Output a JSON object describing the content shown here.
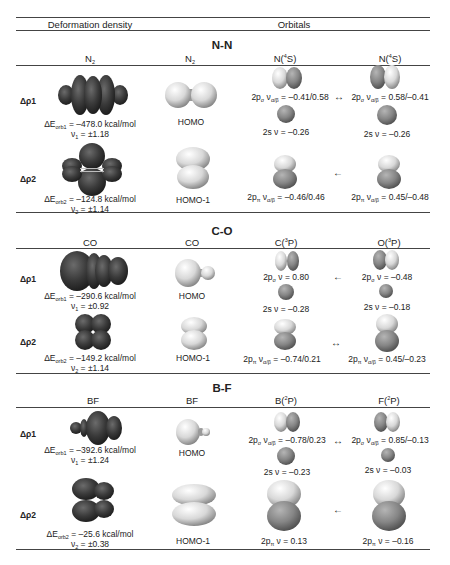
{
  "table": {
    "header_left": "Deformation density",
    "header_right": "Orbitals"
  },
  "sections": [
    {
      "title": "N-N",
      "columns": {
        "density": {
          "base": "N",
          "sub": "2"
        },
        "orbital": {
          "base": "N",
          "sub": "2"
        },
        "atom_a": {
          "base": "N(",
          "sup": "4",
          "tail": "S)"
        },
        "atom_b": {
          "base": "N(",
          "sup": "4",
          "tail": "S)"
        }
      },
      "rows": [
        {
          "label": "Δρ1",
          "energy_prefix": "ΔE",
          "energy_sub": "orb1",
          "energy_value": " = –478.0 kcal/mol",
          "nu_prefix": "ν",
          "nu_sub": "1",
          "nu_value": " = ±1.18",
          "mo": "HOMO",
          "a1": {
            "p": "2p",
            "psub": "σ",
            "nu": " ν",
            "nusub": "α/β",
            "val": " = –0.41/0.58"
          },
          "a2": {
            "p": "2s ν = –0.26"
          },
          "arrow": "↔",
          "b1": {
            "p": "2p",
            "psub": "σ",
            "nu": " ν",
            "nusub": "α/β",
            "val": " = 0.58/–0.41"
          },
          "b2": {
            "p": "2s ν = –0.26"
          }
        },
        {
          "label": "Δρ2",
          "energy_prefix": "ΔE",
          "energy_sub": "orb2",
          "energy_value": " = –124.8 kcal/mol",
          "nu_prefix": "ν",
          "nu_sub": "2",
          "nu_value": " = ±1.14",
          "mo": "HOMO-1",
          "a1": {
            "p": "2p",
            "psub": "π",
            "nu": " ν",
            "nusub": "α/β",
            "val": " = –0.46/0.46"
          },
          "arrow": "←",
          "b1": {
            "p": "2p",
            "psub": "π",
            "nu": " ν",
            "nusub": "α/β",
            "val": " = 0.45/–0.48"
          }
        }
      ]
    },
    {
      "title": "C-O",
      "columns": {
        "density": {
          "base": "CO"
        },
        "orbital": {
          "base": "CO"
        },
        "atom_a": {
          "base": "C(",
          "sup": "3",
          "tail": "P)"
        },
        "atom_b": {
          "base": "O(",
          "sup": "3",
          "tail": "P)"
        }
      },
      "rows": [
        {
          "label": "Δρ1",
          "energy_prefix": "ΔE",
          "energy_sub": "orb1",
          "energy_value": " = –290.6 kcal/mol",
          "nu_prefix": "ν",
          "nu_sub": "1",
          "nu_value": " = ±0.92",
          "mo": "HOMO",
          "a1": {
            "p": "2p",
            "psub": "σ",
            "nu": " ν",
            "val": " = 0.80"
          },
          "a2": {
            "p": "2s ν = –0.28"
          },
          "arrow": "←",
          "b1": {
            "p": "2p",
            "psub": "σ",
            "nu": " ν",
            "val": " = –0.48"
          },
          "b2": {
            "p": "2s ν = –0.18"
          }
        },
        {
          "label": "Δρ2",
          "energy_prefix": "ΔE",
          "energy_sub": "orb2",
          "energy_value": " = –149.2 kcal/mol",
          "nu_prefix": "ν",
          "nu_sub": "2",
          "nu_value": " = ±1.14",
          "mo": "HOMO-1",
          "a1": {
            "p": "2p",
            "psub": "π",
            "nu": " ν",
            "nusub": "α/β",
            "val": " = –0.74/0.21"
          },
          "arrow": "↔",
          "b1": {
            "p": "2p",
            "psub": "π",
            "nu": " ν",
            "nusub": "α/β",
            "val": " = 0.45/–0.23"
          }
        }
      ]
    },
    {
      "title": "B-F",
      "columns": {
        "density": {
          "base": "BF"
        },
        "orbital": {
          "base": "BF"
        },
        "atom_a": {
          "base": "B(",
          "sup": "2",
          "tail": "P)"
        },
        "atom_b": {
          "base": "F(",
          "sup": "2",
          "tail": "P)"
        }
      },
      "rows": [
        {
          "label": "Δρ1",
          "energy_prefix": "ΔE",
          "energy_sub": "orb1",
          "energy_value": " = –392.6 kcal/mol",
          "nu_prefix": "ν",
          "nu_sub": "1",
          "nu_value": " = ±1.24",
          "mo": "HOMO",
          "a1": {
            "p": "2p",
            "psub": "σ",
            "nu": " ν",
            "nusub": "α/β",
            "val": " = –0.78/0.23"
          },
          "a2": {
            "p": "2s ν = –0.23"
          },
          "arrow": "↔",
          "b1": {
            "p": "2p",
            "psub": "σ",
            "nu": " ν",
            "nusub": "α/β",
            "val": " = 0.85/–0.13"
          },
          "b2": {
            "p": "2s ν = –0.03"
          }
        },
        {
          "label": "Δρ2",
          "energy_prefix": "ΔE",
          "energy_sub": "orb2",
          "energy_value": " = –25.6 kcal/mol",
          "nu_prefix": "ν",
          "nu_sub": "2",
          "nu_value": " = ±0.38",
          "mo": "HOMO-1",
          "a1": {
            "p": "2p",
            "psub": "π",
            "nu": " ν",
            "val": " = 0.13"
          },
          "arrow": "←",
          "b1": {
            "p": "2p",
            "psub": "π",
            "nu": " ν",
            "val": " = –0.16"
          }
        }
      ]
    }
  ],
  "colors": {
    "density_lobe": "#3a3a3a",
    "orbital_light": "#e8e8e8",
    "orbital_dark": "#7a7a7a",
    "rule": "#444444"
  }
}
